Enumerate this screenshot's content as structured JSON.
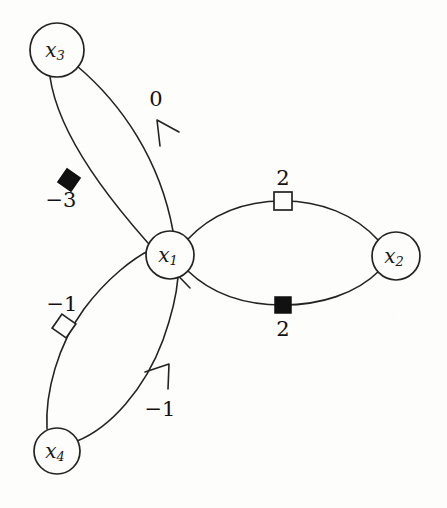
{
  "figure": {
    "background_color": "#fdfdfc",
    "stroke_color": "#232323",
    "marker_fill_color": "#111111"
  },
  "nodes": [
    {
      "id": "x1",
      "label_base": "x",
      "label_sub": "1",
      "cx": 170,
      "cy": 255,
      "r": 24
    },
    {
      "id": "x2",
      "label_base": "x",
      "label_sub": "2",
      "cx": 396,
      "cy": 256,
      "r": 24
    },
    {
      "id": "x3",
      "label_base": "x",
      "label_sub": "3",
      "cx": 57,
      "cy": 50,
      "r": 27
    },
    {
      "id": "x4",
      "label_base": "x",
      "label_sub": "4",
      "cx": 57,
      "cy": 451,
      "r": 23
    }
  ],
  "edges": [
    {
      "id": "e-x3-x1-upper",
      "from": "x3",
      "to": "x1",
      "label": "0",
      "label_x": 156,
      "label_y": 100,
      "marker": "arrow",
      "marker_direction": "toward-x3"
    },
    {
      "id": "e-x3-x1-lower",
      "from": "x3",
      "to": "x1",
      "label": "−3",
      "label_x": 61,
      "label_y": 201,
      "marker": "filled-square",
      "marker_x": 69,
      "marker_y": 180,
      "marker_rotation": 35
    },
    {
      "id": "e-x1-x2-upper",
      "from": "x1",
      "to": "x2",
      "label": "2",
      "label_x": 283,
      "label_y": 179,
      "marker": "open-square",
      "marker_x": 283,
      "marker_y": 201,
      "marker_rotation": 0
    },
    {
      "id": "e-x1-x2-lower",
      "from": "x1",
      "to": "x2",
      "label": "2",
      "label_x": 283,
      "label_y": 330,
      "marker": "filled-square",
      "marker_x": 283,
      "marker_y": 305,
      "marker_rotation": 0
    },
    {
      "id": "e-x4-x1-upper",
      "from": "x4",
      "to": "x1",
      "label": "−1",
      "label_x": 62,
      "label_y": 305,
      "marker": "open-square",
      "marker_x": 64,
      "marker_y": 326,
      "marker_rotation": 35
    },
    {
      "id": "e-x4-x1-lower",
      "from": "x4",
      "to": "x1",
      "label": "−1",
      "label_x": 160,
      "label_y": 410,
      "marker": "arrow",
      "marker_direction": "toward-x1"
    }
  ],
  "labels": {
    "zero": "0",
    "minus_three": "−3",
    "minus_one_upper": "−1",
    "minus_one_lower": "−1",
    "two_upper": "2",
    "two_lower": "2"
  }
}
